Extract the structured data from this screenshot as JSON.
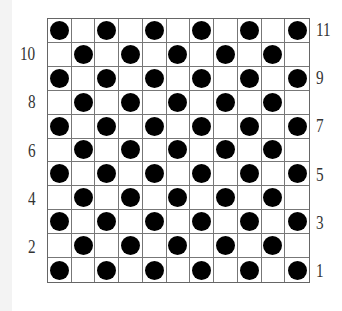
{
  "board": {
    "rows": 11,
    "cols": 11,
    "pattern": "checkerboard",
    "disc_color": "#000000",
    "grid_color": "#777777",
    "description": "Discs placed on cells where (row+col) is even, counting from the top-left cell"
  },
  "labels": {
    "left": [
      {
        "text": "10",
        "row": 2
      },
      {
        "text": "8",
        "row": 4
      },
      {
        "text": "6",
        "row": 6
      },
      {
        "text": "4",
        "row": 8
      },
      {
        "text": "2",
        "row": 10
      }
    ],
    "right": [
      {
        "text": "11",
        "row": 1
      },
      {
        "text": "9",
        "row": 3
      },
      {
        "text": "7",
        "row": 5
      },
      {
        "text": "5",
        "row": 7
      },
      {
        "text": "3",
        "row": 9
      },
      {
        "text": "1",
        "row": 11
      }
    ]
  }
}
